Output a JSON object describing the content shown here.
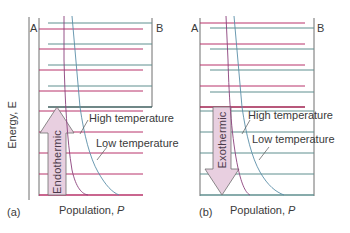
{
  "figure": {
    "axis_label_y": "Energy, E",
    "colors": {
      "red_level": "#b8336a",
      "teal_level": "#5f8f8f",
      "axis": "#6e6e6e",
      "high_temp_curve": "#8a3f7a",
      "low_temp_curve": "#5a8fa8",
      "arrow_fill": "#e8cfe0",
      "arrow_stroke": "#6e6e6e"
    }
  },
  "panel_a": {
    "tag": "(a)",
    "label_A": "A",
    "label_B": "B",
    "arrow_label": "Endothermic",
    "arrow_direction": "up",
    "high_temp_label": "High temperature",
    "low_temp_label": "Low temperature",
    "xlabel_text": "Population, ",
    "xlabel_var": "P"
  },
  "panel_b": {
    "tag": "(b)",
    "label_A": "A",
    "label_B": "B",
    "arrow_label": "Exothermic",
    "arrow_direction": "down",
    "high_temp_label": "High temperature",
    "low_temp_label": "Low temperature",
    "xlabel_text": "Population, ",
    "xlabel_var": "P"
  }
}
